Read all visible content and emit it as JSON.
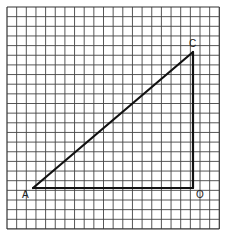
{
  "diagram": {
    "type": "right-triangle-on-grid",
    "grid": {
      "cols": 22,
      "rows": 23,
      "left": 7,
      "top": 7,
      "cell": 9.65,
      "line_color": "#444444",
      "border_color": "#333333"
    },
    "points": {
      "A": {
        "label": "A",
        "x": 33,
        "y": 188
      },
      "O": {
        "label": "O",
        "x": 193,
        "y": 188
      },
      "C": {
        "label": "C",
        "x": 193,
        "y": 52
      }
    },
    "segments": [
      {
        "from": "A",
        "to": "O"
      },
      {
        "from": "O",
        "to": "C"
      },
      {
        "from": "A",
        "to": "C"
      }
    ],
    "stroke_color": "#111111"
  }
}
